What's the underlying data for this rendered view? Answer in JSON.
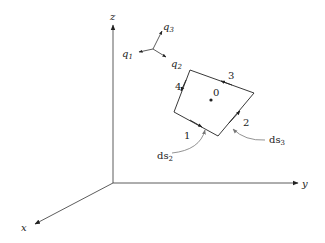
{
  "figure": {
    "axes": {
      "x": "x",
      "y": "y",
      "z": "z"
    },
    "triad": {
      "q1": "q",
      "q1_sub": "1",
      "q2": "q",
      "q2_sub": "2",
      "q3": "q",
      "q3_sub": "3"
    },
    "element": {
      "center_label": "0",
      "edges": [
        "1",
        "2",
        "3",
        "4"
      ],
      "ds2": "ds",
      "ds2_sub": "2",
      "ds3": "ds",
      "ds3_sub": "3"
    },
    "colors": {
      "line": "#222222",
      "pointer": "#777777"
    }
  }
}
